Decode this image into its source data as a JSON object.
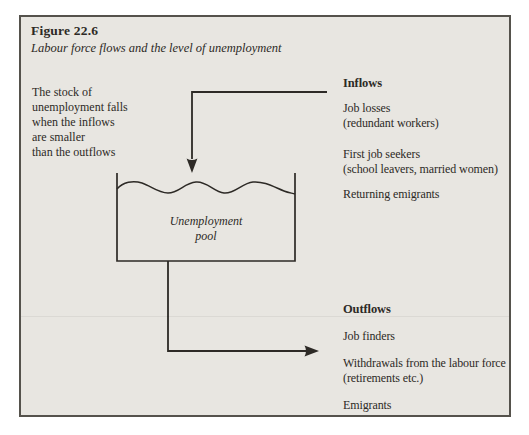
{
  "figure": {
    "label": "Figure 22.6",
    "caption": "Labour force flows and the level of unemployment"
  },
  "note": {
    "lines": [
      "The stock of",
      "unemployment falls",
      "when the inflows",
      "are smaller",
      "than the outflows"
    ]
  },
  "pool": {
    "line1": "Unemployment",
    "line2": "pool"
  },
  "inflows": {
    "heading": "Inflows",
    "items": [
      {
        "line1": "Job losses",
        "line2": "(redundant workers)"
      },
      {
        "line1": "First job seekers",
        "line2": "(school leavers, married women)"
      },
      {
        "line1": "Returning emigrants",
        "line2": ""
      }
    ]
  },
  "outflows": {
    "heading": "Outflows",
    "items": [
      {
        "line1": "Job finders",
        "line2": ""
      },
      {
        "line1": "Withdrawals from the labour force",
        "line2": "(retirements etc.)"
      },
      {
        "line1": "Emigrants",
        "line2": ""
      }
    ]
  },
  "colors": {
    "paper": "#e8e6e1",
    "frame_border": "#55524c",
    "ink": "#2d2a26"
  }
}
